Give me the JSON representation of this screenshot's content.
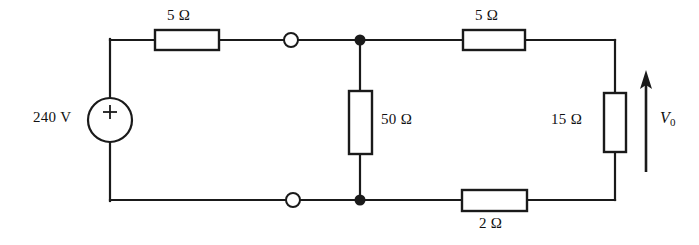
{
  "figure": {
    "background_color": "#ffffff",
    "line_color": "#1a1a1a"
  },
  "source": {
    "label": "240 V",
    "polarity_mark": "+",
    "symbol": "voltage-source-circle"
  },
  "components": [
    {
      "id": "r-top-left",
      "label": "5 Ω",
      "value": 5,
      "unit": "Ω",
      "orientation": "horizontal"
    },
    {
      "id": "r-top-right",
      "label": "5 Ω",
      "value": 5,
      "unit": "Ω",
      "orientation": "horizontal"
    },
    {
      "id": "r-middle",
      "label": "50 Ω",
      "value": 50,
      "unit": "Ω",
      "orientation": "vertical"
    },
    {
      "id": "r-right",
      "label": "15 Ω",
      "value": 15,
      "unit": "Ω",
      "orientation": "vertical"
    },
    {
      "id": "r-bottom",
      "label": "2 Ω",
      "value": 2,
      "unit": "Ω",
      "orientation": "horizontal"
    }
  ],
  "measurement": {
    "label_symbol": "V",
    "label_subscript": "0",
    "direction": "up",
    "across": "r-right"
  },
  "terminals": {
    "open_count": 2,
    "junction_count": 2
  }
}
